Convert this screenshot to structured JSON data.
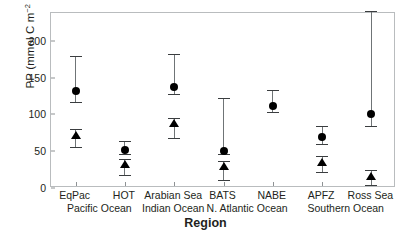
{
  "chart_data": {
    "type": "scatter",
    "title": "",
    "xlabel": "Region",
    "ylabel": "PP (mmol C m⁻² d⁻¹)",
    "ylabel_parts": {
      "prefix": "PP (mmol C m",
      "sup1": "−2",
      "mid": " d",
      "sup2": "−1",
      "suffix": ")"
    },
    "ylim": [
      0,
      238
    ],
    "yticks": [
      0,
      50,
      100,
      150,
      200
    ],
    "ytick_labels": [
      "0",
      "50",
      "100",
      "150",
      "200"
    ],
    "grid": false,
    "legend": "none",
    "categories": [
      "EqPac",
      "HOT",
      "Arabian Sea",
      "BATS",
      "NABE",
      "APFZ",
      "Ross Sea"
    ],
    "group_labels": [
      {
        "text": "Pacific Ocean",
        "spans": [
          "EqPac",
          "HOT"
        ]
      },
      {
        "text": "Indian Ocean",
        "spans": [
          "Arabian Sea"
        ]
      },
      {
        "text": "N. Atlantic Ocean",
        "spans": [
          "BATS",
          "NABE"
        ]
      },
      {
        "text": "Southern Ocean",
        "spans": [
          "APFZ",
          "Ross Sea"
        ]
      }
    ],
    "series": [
      {
        "name": "circle-series",
        "marker": "circle",
        "color": "#000000",
        "points": [
          {
            "category": "EqPac",
            "value": 129,
            "low": 114,
            "high": 177
          },
          {
            "category": "HOT",
            "value": 49,
            "low": 44,
            "high": 61
          },
          {
            "category": "Arabian Sea",
            "value": 135,
            "low": 125,
            "high": 180
          },
          {
            "category": "BATS",
            "value": 48,
            "low": 43,
            "high": 120
          },
          {
            "category": "NABE",
            "value": 109,
            "low": 101,
            "high": 131
          },
          {
            "category": "APFZ",
            "value": 67,
            "low": 57,
            "high": 81
          },
          {
            "category": "Ross Sea",
            "value": 98,
            "low": 81,
            "high": 238
          }
        ]
      },
      {
        "name": "triangle-series",
        "marker": "triangle",
        "color": "#000000",
        "points": [
          {
            "category": "EqPac",
            "value": 69,
            "low": 53,
            "high": 78
          },
          {
            "category": "HOT",
            "value": 30,
            "low": 15,
            "high": 37
          },
          {
            "category": "Arabian Sea",
            "value": 86,
            "low": 65,
            "high": 92
          },
          {
            "category": "BATS",
            "value": 27,
            "low": 8,
            "high": 34
          },
          {
            "category": "APFZ",
            "value": 33,
            "low": 19,
            "high": 41
          },
          {
            "category": "Ross Sea",
            "value": 13,
            "low": 1,
            "high": 22
          }
        ]
      }
    ]
  },
  "axis": {
    "x_title": "Region",
    "frame_color": "#b9bcbe",
    "tick_color": "#8e9294"
  }
}
